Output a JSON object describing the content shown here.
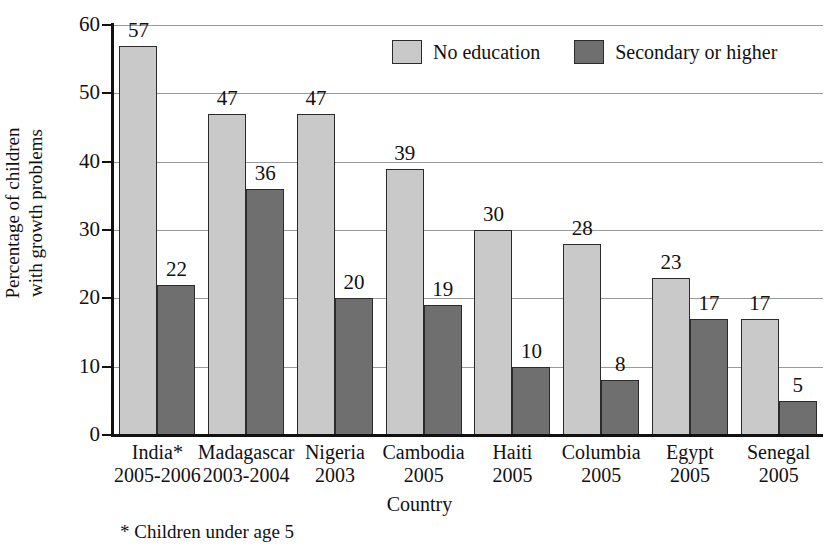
{
  "chart_data": {
    "type": "bar",
    "title": "",
    "xlabel": "Country",
    "ylabel": "Percentage of children\nwith growth problems",
    "ylim": [
      0,
      60
    ],
    "yticks": [
      0,
      10,
      20,
      30,
      40,
      50,
      60
    ],
    "grid": true,
    "legend_position": "top-center",
    "footnote": "* Children under age 5",
    "categories": [
      "India*",
      "Madagascar",
      "Nigeria",
      "Cambodia",
      "Haiti",
      "Columbia",
      "Egypt",
      "Senegal"
    ],
    "category_years": [
      "2005-2006",
      "2003-2004",
      "2003",
      "2005",
      "2005",
      "2005",
      "2005",
      "2005"
    ],
    "series": [
      {
        "name": "No education",
        "color": "#c9c9c9",
        "values": [
          57,
          47,
          47,
          39,
          30,
          28,
          23,
          17
        ]
      },
      {
        "name": "Secondary or higher",
        "color": "#6f6f6f",
        "values": [
          22,
          36,
          20,
          19,
          10,
          8,
          17,
          5
        ]
      }
    ]
  }
}
